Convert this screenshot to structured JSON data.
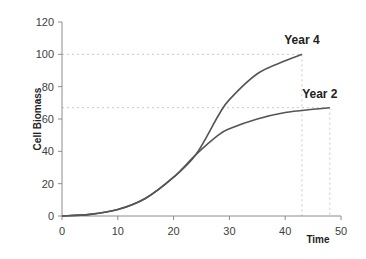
{
  "chart_data": {
    "type": "line",
    "title": "",
    "xlabel": "Time",
    "ylabel": "Cell Biomass",
    "xlim": [
      0,
      50
    ],
    "ylim": [
      0,
      120
    ],
    "xticks": [
      0,
      10,
      20,
      30,
      40,
      50
    ],
    "yticks": [
      0,
      20,
      40,
      60,
      80,
      100,
      120
    ],
    "grid": false,
    "legend": "inline labels at curve ends",
    "series": [
      {
        "name": "Year 4",
        "color": "#555555",
        "x": [
          0,
          5,
          10,
          15,
          20,
          24,
          28,
          30,
          35,
          40,
          43
        ],
        "y": [
          0,
          1,
          4,
          11,
          24,
          38,
          62,
          72,
          88,
          96,
          100
        ]
      },
      {
        "name": "Year 2",
        "color": "#555555",
        "x": [
          0,
          5,
          10,
          15,
          20,
          24,
          28,
          30,
          35,
          40,
          45,
          48
        ],
        "y": [
          0,
          1,
          4,
          11,
          24,
          38,
          50,
          54,
          60,
          64,
          66,
          67
        ]
      }
    ],
    "annotations": [
      {
        "type": "dashed-hline",
        "y": 100,
        "x_end": 43
      },
      {
        "type": "dashed-hline",
        "y": 67,
        "x_end": 48
      },
      {
        "type": "dashed-vline",
        "x": 43,
        "y_end": 100
      },
      {
        "type": "dashed-vline",
        "x": 48,
        "y_end": 67
      }
    ]
  }
}
